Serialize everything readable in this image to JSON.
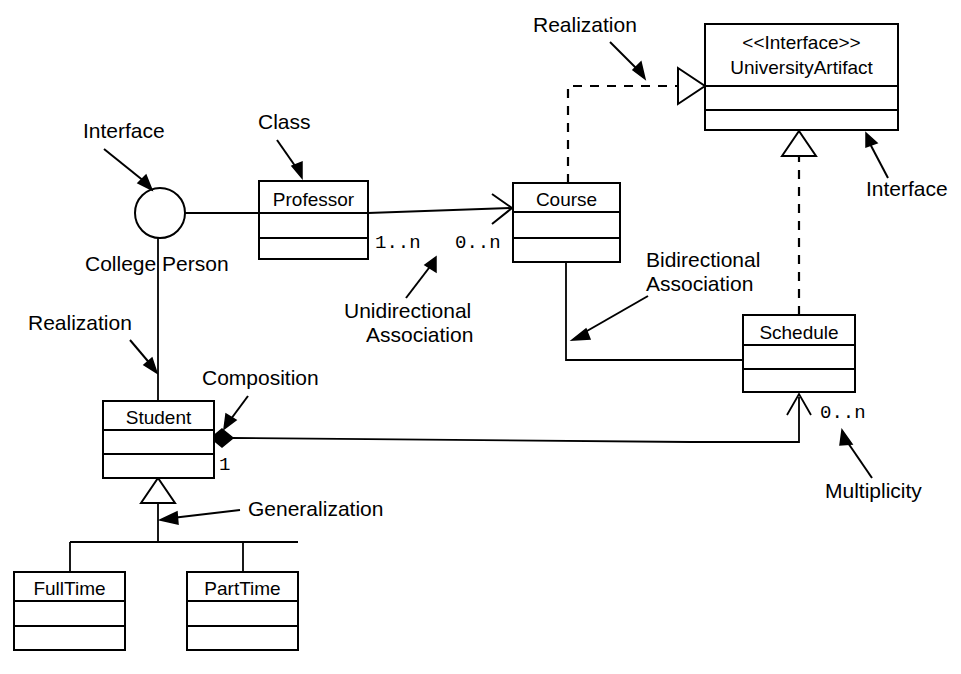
{
  "diagram": {
    "colors": {
      "stroke": "#000000",
      "fill": "#ffffff",
      "background": "#ffffff"
    },
    "classes": [
      {
        "id": "professor",
        "name": "Professor",
        "stereotype": "",
        "x": 259,
        "y": 181,
        "w": 109,
        "h": 78
      },
      {
        "id": "course",
        "name": "Course",
        "stereotype": "",
        "x": 513,
        "y": 183,
        "w": 107,
        "h": 79
      },
      {
        "id": "university_artifact",
        "name": "UniversityArtifact",
        "stereotype": "<<Interface>>",
        "x": 705,
        "y": 24,
        "w": 193,
        "h": 106
      },
      {
        "id": "schedule",
        "name": "Schedule",
        "stereotype": "",
        "x": 743,
        "y": 315,
        "w": 112,
        "h": 77
      },
      {
        "id": "student",
        "name": "Student",
        "stereotype": "",
        "x": 103,
        "y": 401,
        "w": 111,
        "h": 77
      },
      {
        "id": "fulltime",
        "name": "FullTime",
        "stereotype": "",
        "x": 14,
        "y": 572,
        "w": 111,
        "h": 78
      },
      {
        "id": "parttime",
        "name": "PartTime",
        "stereotype": "",
        "x": 187,
        "y": 572,
        "w": 111,
        "h": 78
      }
    ],
    "interface_lollipop": {
      "name": "College Person",
      "cx": 160,
      "cy": 213,
      "r": 25
    },
    "multiplicities": [
      {
        "id": "prof_mult",
        "text": "1..n",
        "x": 375,
        "y": 248
      },
      {
        "id": "course_mult",
        "text": "0..n",
        "x": 455,
        "y": 248
      },
      {
        "id": "student_mult",
        "text": "1",
        "x": 222,
        "y": 463
      },
      {
        "id": "schedule_mult",
        "text": "0..n",
        "x": 820,
        "y": 418
      }
    ],
    "annotations": [
      {
        "id": "interface_left",
        "lines": [
          "Interface"
        ],
        "x": 83,
        "y": 138
      },
      {
        "id": "class_label",
        "lines": [
          "Class"
        ],
        "x": 258,
        "y": 129
      },
      {
        "id": "realization_top",
        "lines": [
          "Realization"
        ],
        "x": 533,
        "y": 32
      },
      {
        "id": "interface_right",
        "lines": [
          "Interface"
        ],
        "x": 866,
        "y": 196
      },
      {
        "id": "unidirectional",
        "lines": [
          "Unidirectional",
          "Association"
        ],
        "x": 344,
        "y": 318
      },
      {
        "id": "bidirectional",
        "lines": [
          "Bidirectional",
          "Association"
        ],
        "x": 646,
        "y": 267
      },
      {
        "id": "realization_left",
        "lines": [
          "Realization"
        ],
        "x": 28,
        "y": 330
      },
      {
        "id": "composition",
        "lines": [
          "Composition"
        ],
        "x": 202,
        "y": 385
      },
      {
        "id": "generalization",
        "lines": [
          "Generalization"
        ],
        "x": 248,
        "y": 516
      },
      {
        "id": "multiplicity",
        "lines": [
          "Multiplicity"
        ],
        "x": 825,
        "y": 498
      },
      {
        "id": "college_person",
        "lines": [
          "College Person"
        ],
        "x": 85,
        "y": 271
      }
    ],
    "relationships": [
      {
        "id": "professor-collegeperson",
        "type": "interface-realization-lollipop",
        "from": "interface-circle",
        "to": "professor"
      },
      {
        "id": "professor-course",
        "type": "unidirectional-association",
        "from": "professor",
        "to": "course",
        "source_mult": "1..n",
        "target_mult": "0..n"
      },
      {
        "id": "course-universityartifact",
        "type": "realization",
        "from": "course",
        "to": "university_artifact"
      },
      {
        "id": "schedule-universityartifact",
        "type": "realization",
        "from": "schedule",
        "to": "university_artifact"
      },
      {
        "id": "course-schedule",
        "type": "bidirectional-association",
        "from": "course",
        "to": "schedule"
      },
      {
        "id": "student-schedule",
        "type": "composition",
        "from": "student",
        "to": "schedule",
        "source_mult": "1",
        "target_mult": "0..n"
      },
      {
        "id": "collegeperson-student",
        "type": "realization",
        "from": "interface-circle",
        "to": "student"
      },
      {
        "id": "student-fulltime",
        "type": "generalization",
        "from": "fulltime",
        "to": "student"
      },
      {
        "id": "student-parttime",
        "type": "generalization",
        "from": "parttime",
        "to": "student"
      }
    ]
  }
}
